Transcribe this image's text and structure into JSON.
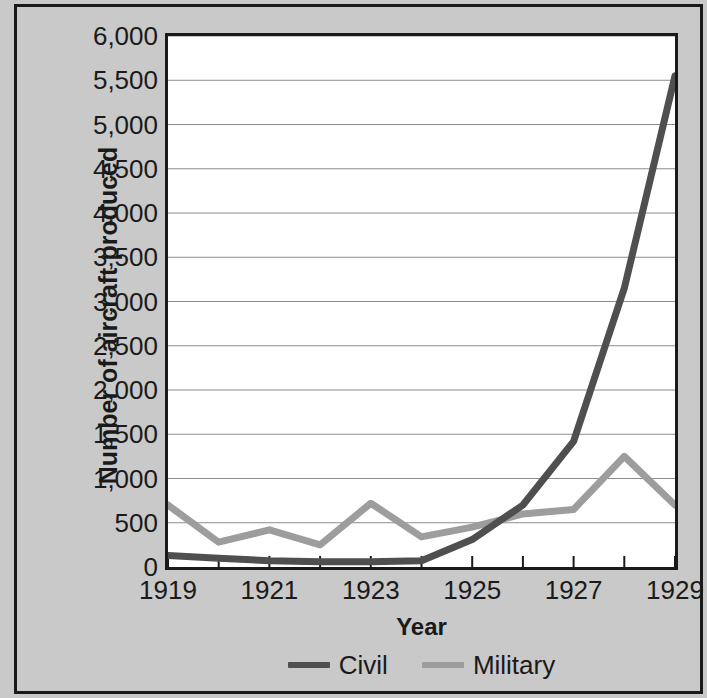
{
  "chart_data": {
    "type": "line",
    "title": "",
    "xlabel": "Year",
    "ylabel": "Number of aircraft produced",
    "x": [
      1919,
      1920,
      1921,
      1922,
      1923,
      1924,
      1925,
      1926,
      1927,
      1928,
      1929
    ],
    "categories": [
      "1919",
      "1920",
      "1921",
      "1922",
      "1923",
      "1924",
      "1925",
      "1926",
      "1927",
      "1928",
      "1929"
    ],
    "series": [
      {
        "name": "Civil",
        "color": "#4f4f4f",
        "values": [
          130,
          100,
          70,
          60,
          60,
          70,
          310,
          700,
          1420,
          3150,
          5550
        ]
      },
      {
        "name": "Military",
        "color": "#9d9d9d",
        "values": [
          700,
          280,
          420,
          250,
          720,
          340,
          450,
          600,
          650,
          1250,
          700
        ]
      }
    ],
    "xlim": [
      1919,
      1929
    ],
    "ylim": [
      0,
      6000
    ],
    "ytick_step": 500,
    "yticks": [
      0,
      500,
      1000,
      1500,
      2000,
      2500,
      3000,
      3500,
      4000,
      4500,
      5000,
      5500,
      6000
    ],
    "ytick_labels": [
      "0",
      "500",
      "1,000",
      "1,500",
      "2,000",
      "2,500",
      "3,000",
      "3,500",
      "4,000",
      "4,500",
      "5,000",
      "5,500",
      "6,000"
    ],
    "xticks": [
      1919,
      1921,
      1923,
      1925,
      1927,
      1929
    ],
    "xtick_labels": [
      "1919",
      "1921",
      "1923",
      "1925",
      "1927",
      "1929"
    ],
    "grid": "horizontal",
    "legend_position": "bottom-center",
    "legend_entries": [
      "Civil",
      "Military"
    ],
    "colors": {
      "background": "#c9c9c9",
      "plot_background": "#ffffff",
      "frame": "#1a1a1a",
      "gridline": "#8d8d8d",
      "civil": "#4f4f4f",
      "military": "#9d9d9d"
    }
  }
}
